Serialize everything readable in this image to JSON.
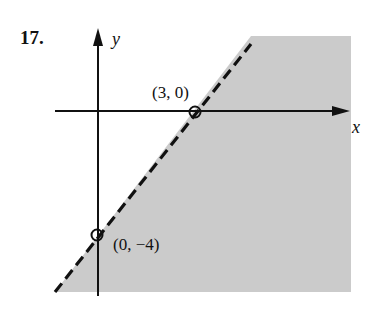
{
  "problem_number": "17.",
  "axes": {
    "x_label": "x",
    "y_label": "y"
  },
  "points": [
    {
      "label": "(3, 0)",
      "x": 3,
      "y": 0,
      "open": true
    },
    {
      "label": "(0, −4)",
      "x": 0,
      "y": -4,
      "open": true
    }
  ],
  "boundary": {
    "style": "dashed",
    "equation_through": [
      "(3, 0)",
      "(0, -4)"
    ]
  },
  "region": {
    "shaded_side": "below-right of line",
    "color": "#c8c8c8"
  }
}
